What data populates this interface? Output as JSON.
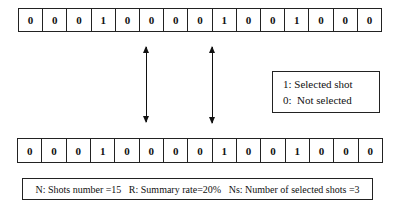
{
  "top_sequence": [
    "0",
    "0",
    "0",
    "1",
    "0",
    "0",
    "0",
    "0",
    "1",
    "0",
    "0",
    "1",
    "0",
    "0",
    "0"
  ],
  "bottom_sequence": [
    "0",
    "0",
    "0",
    "1",
    "0",
    "0",
    "0",
    "0",
    "1",
    "0",
    "0",
    "1",
    "0",
    "0",
    "0"
  ],
  "legend": {
    "selected": "1: Selected shot",
    "not_selected": "0:  Not selected"
  },
  "summary": {
    "shots": "N: Shots number =15",
    "rate": "R: Summary rate=20%",
    "selected_count": "Ns: Number of selected shots =3"
  }
}
